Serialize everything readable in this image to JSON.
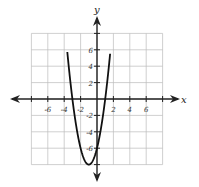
{
  "chart_data": {
    "type": "line",
    "title": "",
    "xlabel": "x",
    "ylabel": "y",
    "xlim": [
      -8,
      8
    ],
    "ylim": [
      -8,
      8
    ],
    "grid": true,
    "x_ticks": [
      "-6",
      "-4",
      "-2",
      "2",
      "4",
      "6"
    ],
    "y_ticks": [
      "6",
      "4",
      "2",
      "-2",
      "-4",
      "-6"
    ],
    "series": [
      {
        "name": "y = 2x^2 + 4x - 6",
        "vertex": [
          -1,
          -8
        ],
        "x_intercepts": [
          -3,
          1
        ],
        "y_intercept": -6,
        "x": [
          -3.6,
          -3,
          -2,
          -1,
          0,
          1,
          1.6
        ],
        "y": [
          7.5,
          0,
          -6,
          -8,
          -6,
          0,
          7.5
        ]
      }
    ]
  }
}
